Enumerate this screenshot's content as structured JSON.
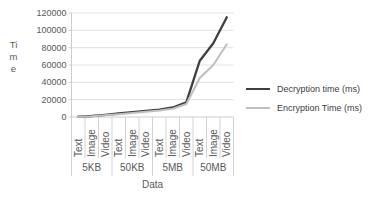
{
  "chart_data": {
    "type": "line",
    "xlabel": "Data",
    "ylabel": "Time",
    "ylim": [
      0,
      120000
    ],
    "ytick_interval": 20000,
    "yticks": [
      "0",
      "20000",
      "40000",
      "60000",
      "80000",
      "100000",
      "120000"
    ],
    "grid": true,
    "legend_position": "right",
    "groups": [
      {
        "label": "5KB",
        "subcategories": [
          "Text",
          "Image",
          "Video"
        ]
      },
      {
        "label": "50KB",
        "subcategories": [
          "Text",
          "Image",
          "Video"
        ]
      },
      {
        "label": "5MB",
        "subcategories": [
          "Text",
          "Image",
          "Video"
        ]
      },
      {
        "label": "50MB",
        "subcategories": [
          "Text",
          "Image",
          "Video"
        ]
      }
    ],
    "series": [
      {
        "name": "Decryption time (ms)",
        "color": "#3f3f3f",
        "values": [
          500,
          1200,
          2500,
          4000,
          5500,
          7000,
          8500,
          11000,
          17000,
          65000,
          85000,
          115000
        ]
      },
      {
        "name": "Encryption Time (ms)",
        "color": "#bfbfbf",
        "values": [
          300,
          900,
          2000,
          3200,
          4500,
          6000,
          7500,
          9500,
          15000,
          45000,
          60000,
          84000
        ]
      }
    ]
  },
  "styles": {
    "background": "#ffffff",
    "axis_text_color": "#595959",
    "legend_text_color": "#404040",
    "gridline_color": "#d9d9d9",
    "axis_line_color": "#c6c6c6"
  }
}
